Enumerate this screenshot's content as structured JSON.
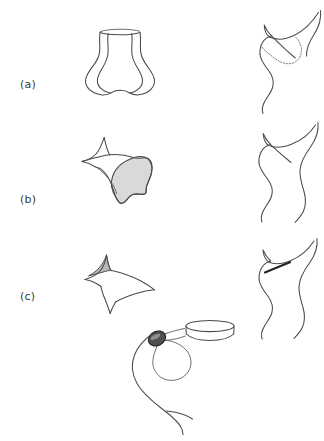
{
  "figure": {
    "background_color": "#ffffff",
    "stroke_color": "#4a4a4a",
    "accent_dark": "#242424",
    "shade_color": "#d9d9d9",
    "width": 324,
    "height": 441
  },
  "rows": [
    {
      "label": "(a)",
      "left_shape_name": "vase-surface",
      "right_shape_name": "cusped-curve-with-dotted-region"
    },
    {
      "label": "(b)",
      "left_shape_name": "four-cusp-shape-with-shaded-region",
      "right_shape_name": "cusped-curve-plain"
    },
    {
      "label": "(c)",
      "left_shape_name": "astroid-with-small-shaded-cusp",
      "right_shape_name": "cusped-curve-with-thick-chord"
    }
  ],
  "bottom": {
    "name": "curve-with-node-and-disk",
    "node_name": "dark-ellipse-node",
    "disk_name": "cylinder-disk"
  }
}
